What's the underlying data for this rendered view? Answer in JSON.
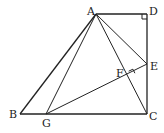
{
  "diagram": {
    "type": "geometry",
    "points": {
      "A": {
        "label": "A",
        "x": 96,
        "y": 14
      },
      "B": {
        "label": "B",
        "x": 20,
        "y": 114
      },
      "C": {
        "label": "C",
        "x": 147,
        "y": 114
      },
      "D": {
        "label": "D",
        "x": 147,
        "y": 14
      },
      "E": {
        "label": "E",
        "x": 147,
        "y": 64
      },
      "F": {
        "label": "F",
        "x": 130,
        "y": 75
      },
      "G": {
        "label": "G",
        "x": 46,
        "y": 114
      }
    },
    "segments": [
      "AB",
      "BC",
      "CD",
      "DA",
      "AG",
      "AC",
      "AE",
      "GE"
    ],
    "right_angles": [
      "ADC",
      "AFE"
    ],
    "colors": {
      "stroke": "#222222",
      "background": "#ffffff"
    }
  }
}
